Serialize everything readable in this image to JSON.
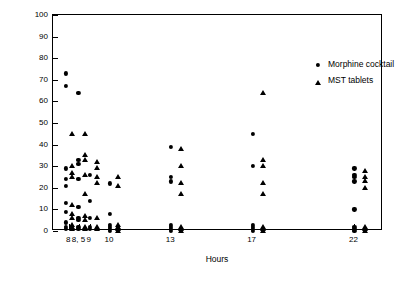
{
  "chart_data": {
    "type": "scatter",
    "title": "",
    "xlabel": "Hours",
    "ylabel": "Visual analogue scale",
    "ylim": [
      0,
      100
    ],
    "yticks": [
      0,
      10,
      20,
      30,
      40,
      50,
      60,
      70,
      80,
      90,
      100
    ],
    "xtick_labels": [
      "8",
      "8, 5",
      "9",
      "10",
      "13",
      "17",
      "22"
    ],
    "xtick_positions": [
      8,
      8.5,
      9,
      10,
      13,
      17,
      22
    ],
    "xlim": [
      7.2,
      23.4
    ],
    "grid": false,
    "legend_position": "upper right inside",
    "series": [
      {
        "name": "Morphine cocktail",
        "marker": "circle",
        "points": [
          [
            7.85,
            73
          ],
          [
            7.85,
            67
          ],
          [
            7.85,
            29
          ],
          [
            7.85,
            24
          ],
          [
            7.85,
            21
          ],
          [
            7.85,
            13
          ],
          [
            7.85,
            9
          ],
          [
            7.85,
            4
          ],
          [
            7.85,
            2
          ],
          [
            7.85,
            1
          ],
          [
            8.45,
            64
          ],
          [
            8.45,
            33
          ],
          [
            8.45,
            31
          ],
          [
            8.45,
            24
          ],
          [
            8.45,
            11
          ],
          [
            8.45,
            6
          ],
          [
            8.45,
            5
          ],
          [
            8.45,
            2
          ],
          [
            8.45,
            1
          ],
          [
            9.0,
            26
          ],
          [
            9.0,
            14
          ],
          [
            9.0,
            6
          ],
          [
            9.0,
            2
          ],
          [
            9.0,
            1
          ],
          [
            10.0,
            22
          ],
          [
            10.0,
            8
          ],
          [
            10.0,
            3
          ],
          [
            10.0,
            2
          ],
          [
            10.0,
            1
          ],
          [
            10.0,
            0
          ],
          [
            13.0,
            39
          ],
          [
            13.0,
            25
          ],
          [
            13.0,
            23
          ],
          [
            13.0,
            3
          ],
          [
            13.0,
            2
          ],
          [
            13.0,
            1
          ],
          [
            13.0,
            0
          ],
          [
            17.0,
            45
          ],
          [
            17.0,
            30
          ],
          [
            17.0,
            3
          ],
          [
            17.0,
            2
          ],
          [
            17.0,
            1
          ],
          [
            17.0,
            0
          ],
          [
            22.0,
            29
          ],
          [
            22.0,
            26
          ],
          [
            22.0,
            25
          ],
          [
            22.0,
            23
          ],
          [
            22.0,
            10
          ],
          [
            22.0,
            2
          ],
          [
            22.0,
            1
          ],
          [
            22.0,
            0
          ]
        ]
      },
      {
        "name": "MST tablets",
        "marker": "triangle",
        "points": [
          [
            8.15,
            45
          ],
          [
            8.15,
            30
          ],
          [
            8.15,
            27
          ],
          [
            8.15,
            25
          ],
          [
            8.15,
            12
          ],
          [
            8.15,
            8
          ],
          [
            8.15,
            6
          ],
          [
            8.15,
            3
          ],
          [
            8.15,
            2
          ],
          [
            8.15,
            1
          ],
          [
            8.75,
            45
          ],
          [
            8.75,
            35
          ],
          [
            8.75,
            33
          ],
          [
            8.75,
            26
          ],
          [
            8.75,
            17
          ],
          [
            8.75,
            7
          ],
          [
            8.75,
            5
          ],
          [
            8.75,
            2
          ],
          [
            8.75,
            1
          ],
          [
            9.35,
            32
          ],
          [
            9.35,
            29
          ],
          [
            9.35,
            25
          ],
          [
            9.35,
            22
          ],
          [
            9.35,
            6
          ],
          [
            9.35,
            2
          ],
          [
            9.35,
            1
          ],
          [
            10.4,
            25
          ],
          [
            10.4,
            21
          ],
          [
            10.4,
            3
          ],
          [
            10.4,
            2
          ],
          [
            10.4,
            1
          ],
          [
            10.4,
            0
          ],
          [
            13.5,
            38
          ],
          [
            13.5,
            30
          ],
          [
            13.5,
            22
          ],
          [
            13.5,
            17
          ],
          [
            13.5,
            2
          ],
          [
            13.5,
            1
          ],
          [
            13.5,
            0
          ],
          [
            17.5,
            64
          ],
          [
            17.5,
            33
          ],
          [
            17.5,
            30
          ],
          [
            17.5,
            22
          ],
          [
            17.5,
            17
          ],
          [
            17.5,
            2
          ],
          [
            17.5,
            1
          ],
          [
            17.5,
            0
          ],
          [
            22.5,
            28
          ],
          [
            22.5,
            25
          ],
          [
            22.5,
            23
          ],
          [
            22.5,
            20
          ],
          [
            22.5,
            2
          ],
          [
            22.5,
            1
          ],
          [
            22.5,
            0
          ]
        ]
      }
    ]
  }
}
